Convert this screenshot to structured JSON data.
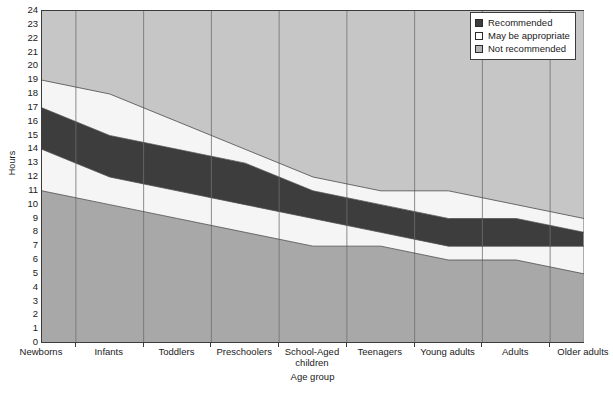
{
  "chart_data": {
    "type": "area",
    "title": "",
    "subtitle": "",
    "xlabel": "Age group",
    "ylabel": "Hours",
    "ylim": [
      0,
      24
    ],
    "ytick_step": 1,
    "yticks": [
      0,
      1,
      2,
      3,
      4,
      5,
      6,
      7,
      8,
      9,
      10,
      11,
      12,
      13,
      14,
      15,
      16,
      17,
      18,
      19,
      20,
      21,
      22,
      23,
      24
    ],
    "grid": "vertical",
    "legend_position": "top-right",
    "stacked": true,
    "categories": [
      "Newborns",
      "Infants",
      "Toddlers",
      "Preschoolers",
      "School-Aged children",
      "Teenagers",
      "Young adults",
      "Adults",
      "Older adults"
    ],
    "bands": [
      {
        "name": "Not recommended",
        "region": "below",
        "color": "#a8a8a8",
        "lower": [
          0,
          0,
          0,
          0,
          0,
          0,
          0,
          0,
          0
        ],
        "upper": [
          11,
          10,
          9,
          8,
          7,
          7,
          6,
          6,
          5
        ]
      },
      {
        "name": "May be appropriate",
        "region": "below",
        "color": "#f5f5f5",
        "lower": [
          11,
          10,
          9,
          8,
          7,
          7,
          6,
          6,
          5
        ],
        "upper": [
          14,
          12,
          11,
          10,
          9,
          8,
          7,
          7,
          7
        ]
      },
      {
        "name": "Recommended",
        "region": "core",
        "color": "#3d3d3d",
        "lower": [
          14,
          12,
          11,
          10,
          9,
          8,
          7,
          7,
          7
        ],
        "upper": [
          17,
          15,
          14,
          13,
          11,
          10,
          9,
          9,
          8
        ]
      },
      {
        "name": "May be appropriate",
        "region": "above",
        "color": "#f5f5f5",
        "lower": [
          17,
          15,
          14,
          13,
          11,
          10,
          9,
          9,
          8
        ],
        "upper": [
          19,
          18,
          16,
          14,
          12,
          11,
          11,
          10,
          9
        ]
      },
      {
        "name": "Not recommended",
        "region": "above",
        "color": "#c6c6c6",
        "lower": [
          19,
          18,
          16,
          14,
          12,
          11,
          11,
          10,
          9
        ],
        "upper": [
          24,
          24,
          24,
          24,
          24,
          24,
          24,
          24,
          24
        ]
      }
    ],
    "series": [
      {
        "name": "Not recommended (low) upper bound",
        "values": [
          11,
          10,
          9,
          8,
          7,
          7,
          6,
          6,
          5
        ]
      },
      {
        "name": "Recommended lower bound",
        "values": [
          14,
          12,
          11,
          10,
          9,
          8,
          7,
          7,
          7
        ]
      },
      {
        "name": "Recommended upper bound",
        "values": [
          17,
          15,
          14,
          13,
          11,
          10,
          9,
          9,
          8
        ]
      },
      {
        "name": "Not recommended (high) lower bound",
        "values": [
          19,
          18,
          16,
          14,
          12,
          11,
          11,
          10,
          9
        ]
      }
    ],
    "legend": [
      {
        "label": "Recommended",
        "color": "#3d3d3d"
      },
      {
        "label": "May be appropriate",
        "color": "#ffffff"
      },
      {
        "label": "Not recommended",
        "color": "#b4b4b4"
      }
    ]
  },
  "caption": {
    "partial_text": ""
  }
}
